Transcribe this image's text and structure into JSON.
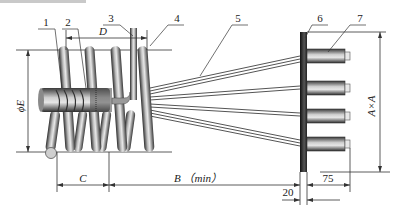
{
  "diagram": {
    "title": "",
    "part_labels": [
      {
        "id": "1",
        "label": "1"
      },
      {
        "id": "2",
        "label": "2"
      },
      {
        "id": "3",
        "label": "3"
      },
      {
        "id": "4",
        "label": "4"
      },
      {
        "id": "5",
        "label": "5"
      },
      {
        "id": "6",
        "label": "6"
      },
      {
        "id": "7",
        "label": "7"
      }
    ],
    "dimensions": {
      "D": "D",
      "E": "ϕE",
      "C": "C",
      "B": "B （min）",
      "AxA": "A×A",
      "d20": "20",
      "d75": "75"
    },
    "colors": {
      "line": "#333333",
      "coil_dark": "#3a3a3a",
      "coil_light": "#d8d8d8",
      "plate": "#1a1a1a",
      "background": "#ffffff"
    }
  }
}
